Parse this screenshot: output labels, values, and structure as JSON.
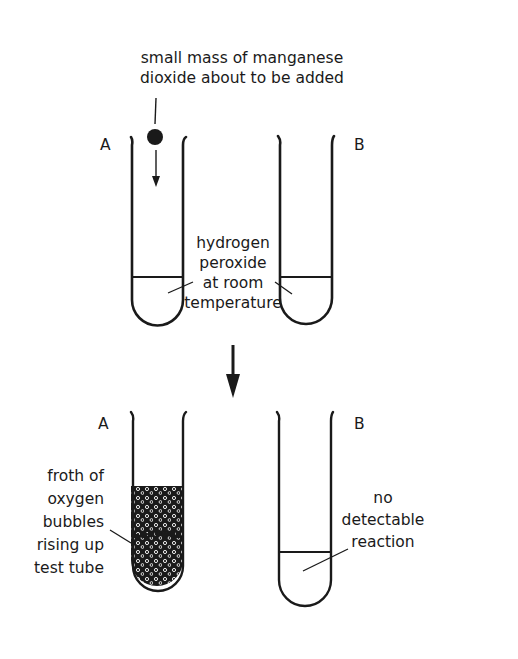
{
  "diagram": {
    "before": {
      "label_tube_a": "A",
      "label_tube_b": "B",
      "annotation_mno2": [
        "small mass of manganese",
        "dioxide about to be added"
      ],
      "annotation_h2o2": [
        "hydrogen",
        "peroxide",
        "at room",
        "temperature"
      ]
    },
    "after": {
      "label_tube_a": "A",
      "label_tube_b": "B",
      "annotation_froth": [
        "froth of",
        "oxygen",
        "bubbles",
        "rising up",
        "test tube"
      ],
      "annotation_no_reaction": [
        "no",
        "detectable",
        "reaction"
      ]
    },
    "colors": {
      "ink": "#1a1a1a",
      "background": "#ffffff"
    }
  }
}
